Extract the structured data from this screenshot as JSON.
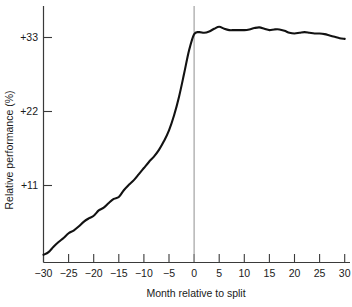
{
  "chart_data": {
    "type": "line",
    "title": "",
    "subtitle": "",
    "xlabel": "Month relative to split",
    "ylabel": "Relative performance (%)",
    "xlim": [
      -30,
      30
    ],
    "ylim": [
      0.7,
      35.5
    ],
    "grid": false,
    "legend": null,
    "xticks": [
      -30,
      -25,
      -20,
      -15,
      -10,
      -5,
      0,
      5,
      10,
      15,
      20,
      25,
      30
    ],
    "xticklabels": [
      "−30",
      "−25",
      "−20",
      "−15",
      "−10",
      "−5",
      "0",
      "5",
      "10",
      "15",
      "20",
      "25",
      "30"
    ],
    "yticks": [
      11,
      22,
      33
    ],
    "yticklabels": [
      "+11",
      "+22",
      "+33"
    ],
    "annotations": [
      {
        "name": "split-reference-line",
        "type": "vline",
        "x": 0,
        "color": "#9a9a9a"
      }
    ],
    "series": [
      {
        "name": "Cumulative average residual",
        "color": "#121212",
        "x": [
          -30,
          -29,
          -28,
          -27,
          -26,
          -25,
          -24,
          -23,
          -22,
          -21,
          -20,
          -19,
          -18,
          -17,
          -16,
          -15,
          -14,
          -13,
          -12,
          -11,
          -10,
          -9,
          -8,
          -7,
          -6,
          -5,
          -4,
          -3,
          -2,
          -1,
          0,
          1,
          2,
          3,
          4,
          5,
          6,
          7,
          8,
          9,
          10,
          11,
          12,
          13,
          14,
          15,
          16,
          17,
          18,
          19,
          20,
          21,
          22,
          23,
          24,
          25,
          26,
          27,
          28,
          29,
          30
        ],
        "values": [
          0.7,
          1.1,
          1.9,
          2.6,
          3.2,
          3.9,
          4.3,
          4.9,
          5.6,
          6.1,
          6.5,
          7.3,
          7.7,
          8.4,
          9.0,
          9.3,
          10.3,
          11.1,
          11.8,
          12.7,
          13.6,
          14.5,
          15.3,
          16.3,
          17.6,
          19.2,
          21.4,
          24.2,
          27.6,
          31.1,
          33.5,
          33.8,
          33.7,
          33.9,
          34.3,
          34.6,
          34.3,
          34.1,
          34.1,
          34.1,
          34.1,
          34.2,
          34.4,
          34.5,
          34.3,
          34.1,
          34.2,
          34.2,
          34.0,
          33.7,
          33.6,
          33.7,
          33.8,
          33.7,
          33.6,
          33.6,
          33.5,
          33.3,
          33.1,
          32.9,
          32.8
        ]
      }
    ]
  },
  "axis": {
    "y_title": "Relative performance (%)",
    "x_title": "Month relative to split",
    "y_labels": [
      "+33",
      "+22",
      "+11"
    ],
    "x_labels": [
      "−30",
      "−25",
      "−20",
      "−15",
      "−10",
      "−5",
      "0",
      "5",
      "10",
      "15",
      "20",
      "25",
      "30"
    ]
  }
}
